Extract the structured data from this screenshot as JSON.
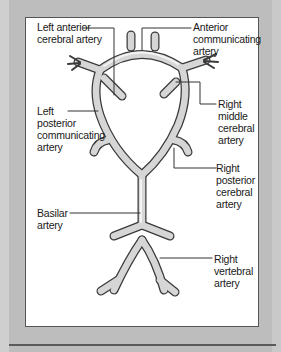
{
  "diagram": {
    "colors": {
      "background": "#bdbdbd",
      "panel": "#ffffff",
      "artery_fill": "#d6d6d6",
      "artery_outline": "#3a3a3a",
      "leader_line": "#333333",
      "text": "#1a1a1a"
    },
    "labels": {
      "left_anterior_cerebral": "Left anterior\ncerebral artery",
      "anterior_communicating": "Anterior\ncommunicating\nartery",
      "right_middle_cerebral": "Right\nmiddle\ncerebral\nartery",
      "left_posterior_communicating": "Left\nposterior\ncommunicating\nartery",
      "right_posterior_cerebral": "Right\nposterior\ncerebral\nartery",
      "basilar": "Basilar\nartery",
      "right_vertebral": "Right\nvertebral\nartery"
    }
  }
}
